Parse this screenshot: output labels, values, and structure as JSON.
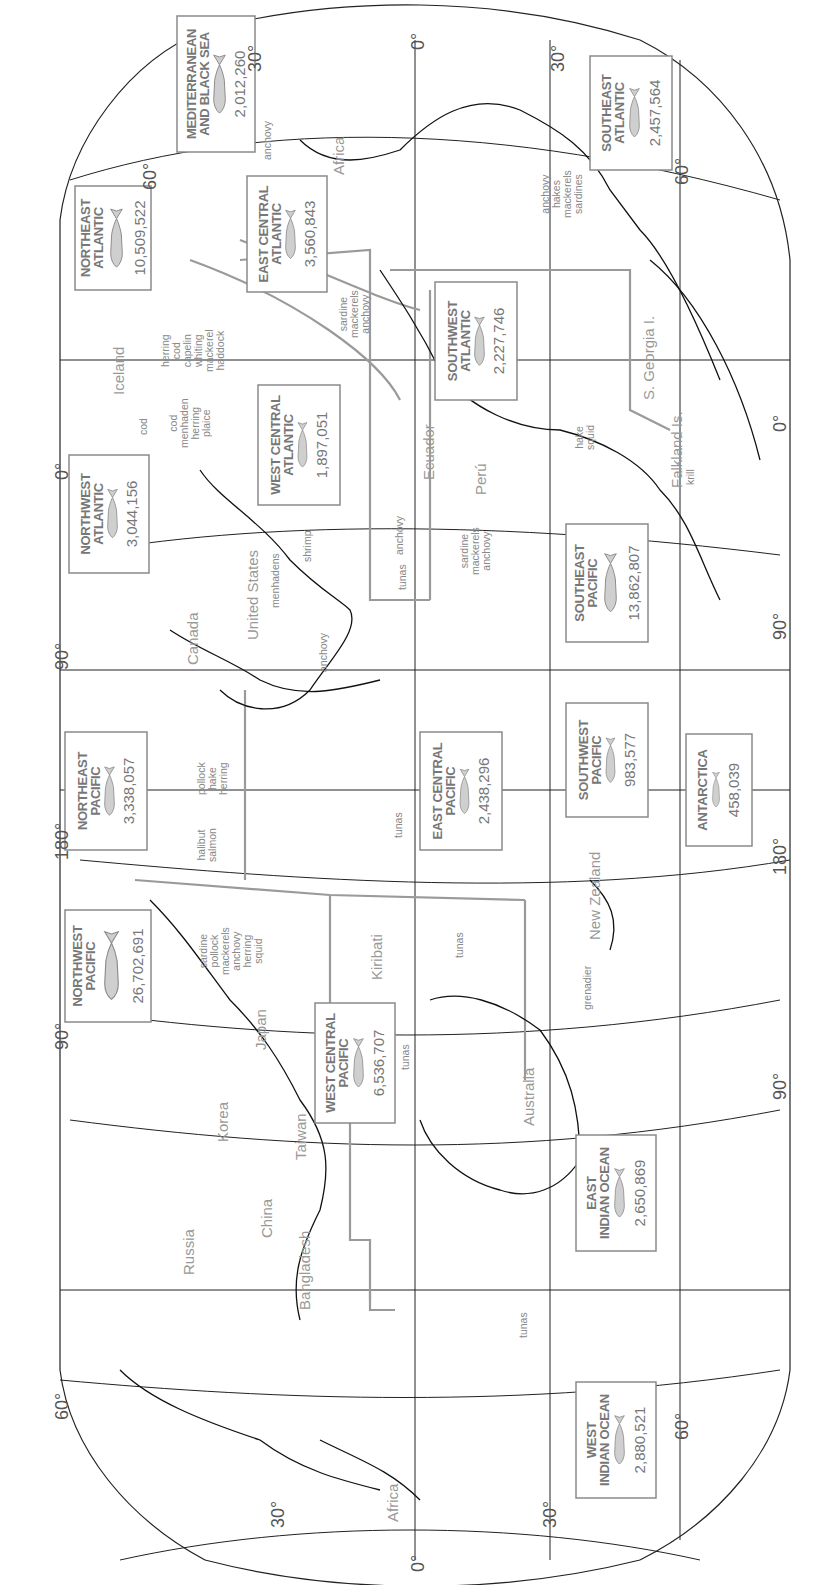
{
  "map": {
    "title": "World fishing regions catch (rotated map)",
    "orientation": "rotated -90 degrees",
    "colors": {
      "coast": "#111111",
      "boundary": "#999999",
      "grid": "#222222",
      "text": "#888888",
      "box_border": "#8a8a8a"
    },
    "longitude_labels_top": [
      "30°",
      "0°",
      "30°"
    ],
    "longitude_labels_left": [
      "60°",
      "0°",
      "90°",
      "180°",
      "90°",
      "60°",
      "30°"
    ],
    "longitude_labels_right": [
      "30°",
      "60°",
      "0°",
      "90°",
      "180°",
      "90°",
      "60°",
      "30°"
    ],
    "axis_labels": {
      "top_left_30": "30°",
      "top_0": "0°",
      "top_right_30": "30°",
      "left_60_a": "60°",
      "left_0": "0°",
      "left_90_a": "90°",
      "left_180": "180°",
      "left_90_b": "90°",
      "left_60_b": "60°",
      "bottom_30_a": "30°",
      "bottom_0": "0°",
      "bottom_30_b": "30°",
      "right_60_a": "60°",
      "right_0": "0°",
      "right_90_a": "90°",
      "right_180": "180°",
      "right_90_b": "90°",
      "right_60_b": "60°"
    },
    "regions": [
      {
        "name": "MEDITERRANEAN\nAND BLACK SEA",
        "catch": "2,012,260"
      },
      {
        "name": "NORTHEAST\nATLANTIC",
        "catch": "10,509,522"
      },
      {
        "name": "EAST CENTRAL\nATLANTIC",
        "catch": "3,560,843"
      },
      {
        "name": "SOUTHEAST\nATLANTIC",
        "catch": "2,457,564"
      },
      {
        "name": "SOUTHWEST\nATLANTIC",
        "catch": "2,227,746"
      },
      {
        "name": "NORTHWEST\nATLANTIC",
        "catch": "3,044,156"
      },
      {
        "name": "WEST CENTRAL\nATLANTIC",
        "catch": "1,897,051"
      },
      {
        "name": "SOUTHEAST\nPACIFIC",
        "catch": "13,862,807"
      },
      {
        "name": "NORTHEAST\nPACIFIC",
        "catch": "3,338,057"
      },
      {
        "name": "EAST CENTRAL\nPACIFIC",
        "catch": "2,438,296"
      },
      {
        "name": "SOUTHWEST\nPACIFIC",
        "catch": "983,577"
      },
      {
        "name": "ANTARCTICA",
        "catch": "458,039"
      },
      {
        "name": "NORTHWEST\nPACIFIC",
        "catch": "26,702,691"
      },
      {
        "name": "WEST CENTRAL\nPACIFIC",
        "catch": "6,536,707"
      },
      {
        "name": "EAST\nINDIAN OCEAN",
        "catch": "2,650,869"
      },
      {
        "name": "WEST\nINDIAN OCEAN",
        "catch": "2,880,521"
      }
    ],
    "countries": [
      "Africa",
      "Iceland",
      "Canada",
      "United States",
      "Ecuador",
      "Perú",
      "Falkland Is.",
      "S. Georgia I.",
      "New Zealand",
      "Kiribati",
      "Japan",
      "Korea",
      "Taiwan",
      "China",
      "Australia",
      "Russia",
      "Bangladesh",
      "Africa"
    ],
    "species": [
      "anchovy",
      "anchovy\nhakes\nmackerels\nsardines",
      "herring\ncod\ncapelin\nwhiting\nmackerel\nhaddock",
      "sardine\nmackerels\nanchovy",
      "cod",
      "cod\nmenhaden\nherring\nplaice",
      "hake\nsquid",
      "krill",
      "menhadens",
      "shrimp",
      "anchovy",
      "tunas",
      "sardine\nmackerels\nanchovy",
      "anchovy",
      "pollock\nhake\nherring",
      "halibut\nsalmon",
      "tunas",
      "sardine\npollock\nmackerels\nanchovy\nherring\nsquid",
      "tunas",
      "grenadier",
      "tunas",
      "tunas"
    ]
  }
}
